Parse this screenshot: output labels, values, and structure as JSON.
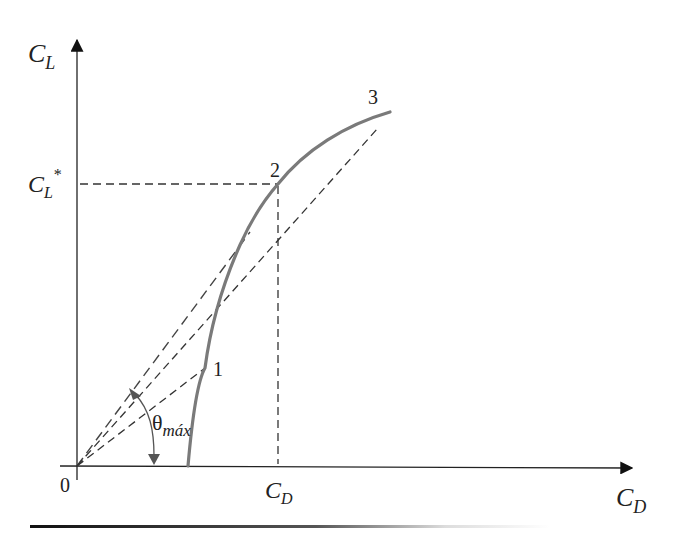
{
  "diagram": {
    "title": "",
    "axes": {
      "y_label_main": "C",
      "y_label_sub": "L",
      "x_label_main": "C",
      "x_label_sub": "D",
      "origin_label": "0"
    },
    "marks": {
      "cl_star_main": "C",
      "cl_star_sub": "L",
      "cl_star_sup": "*",
      "cd_mark_main": "C",
      "cd_mark_sub": "D"
    },
    "points": [
      {
        "label": "1",
        "x": 205,
        "y": 368
      },
      {
        "label": "2",
        "x": 278,
        "y": 184
      },
      {
        "label": "3",
        "x": 390,
        "y": 112
      }
    ],
    "angle": {
      "symbol": "θ",
      "subscript": "máx"
    },
    "colors": {
      "axis": "#222222",
      "curve": "#7a7a7a",
      "dashed": "#333333",
      "angle_arrow": "#555555"
    }
  }
}
